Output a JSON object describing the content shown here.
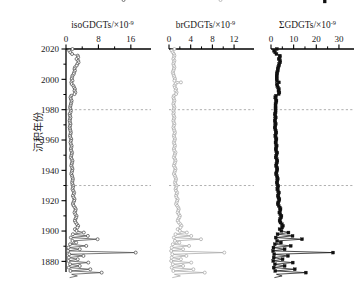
{
  "figure": {
    "background": "#ffffff",
    "y_axis": {
      "label_cn": "沉积年份",
      "label_meaning": "sedimentation-year",
      "ticks": [
        2020,
        2000,
        1980,
        1960,
        1940,
        1920,
        1900,
        1880
      ],
      "range": [
        1873,
        2020
      ],
      "minor_tick_step": 10
    },
    "reference_lines": {
      "style": "dashed",
      "color": "#9a9a9a",
      "years": [
        1980,
        1930
      ]
    }
  },
  "chart_data": [
    {
      "type": "line",
      "title": "isoGDGTs/×10",
      "title_exponent": "-9",
      "panel_index": 0,
      "xlabel": "isoGDGTs/×10⁻⁹",
      "ylabel": "沉积年份",
      "xlim": [
        0,
        19
      ],
      "xticks": [
        0,
        8,
        16
      ],
      "minor_xticks": [
        4,
        12
      ],
      "ylim": [
        1873,
        2020
      ],
      "grid": false,
      "legend": "none",
      "marker": "circle",
      "color": "#4d4d4d",
      "x": [
        1.6,
        0.8,
        1.1,
        1.5,
        2.9,
        3.0,
        2.6,
        3.0,
        3.1,
        2.8,
        2.6,
        2.2,
        2.1,
        2.2,
        2.0,
        1.9,
        1.6,
        1.5,
        1.4,
        1.6,
        1.3,
        1.4,
        1.8,
        2.0,
        2.2,
        2.1,
        2.3,
        2.1,
        1.3,
        1.1,
        1.2,
        1.4,
        1.3,
        1.2,
        1.1,
        1.0,
        1.1,
        1.2,
        1.1,
        0.9,
        1.0,
        1.1,
        1.0,
        0.9,
        1.0,
        1.1,
        1.0,
        0.9,
        1.0,
        1.1,
        1.2,
        1.1,
        1.0,
        1.1,
        1.3,
        1.2,
        1.1,
        1.2,
        1.4,
        1.3,
        1.2,
        1.3,
        1.5,
        1.4,
        1.3,
        1.2,
        1.4,
        1.6,
        1.5,
        1.4,
        1.3,
        1.5,
        1.6,
        1.5,
        1.4,
        1.3,
        1.5,
        1.6,
        1.7,
        1.6,
        1.5,
        1.6,
        1.8,
        1.7,
        1.6,
        1.8,
        2.0,
        1.9,
        1.7,
        1.9,
        2.1,
        2.0,
        1.8,
        1.7,
        1.9,
        2.2,
        2.4,
        2.3,
        2.1,
        2.3,
        2.6,
        2.5,
        2.3,
        2.2,
        2.4,
        2.7,
        3.0,
        2.8,
        2.2,
        2.6,
        4.4,
        1.7,
        5.4,
        1.2,
        7.8,
        1.6,
        2.5,
        1.0,
        5.0,
        0.6,
        3.4,
        0.5,
        17.2,
        0.8,
        4.3,
        0.7,
        2.9,
        0.6,
        5.5,
        1.0,
        3.4,
        0.7,
        6.0,
        1.1,
        8.8,
        1.4,
        2.8,
        0.9,
        14.2
      ],
      "y": [
        2020,
        2018.9,
        2017.8,
        2016.7,
        2015.6,
        2014.5,
        2013.4,
        2012.3,
        2011.2,
        2010.1,
        2009,
        2007.9,
        2006.8,
        2005.7,
        2004.6,
        2003.5,
        2002.4,
        2001.3,
        2000.2,
        1999.1,
        1998,
        1996.9,
        1995.8,
        1994.7,
        1993.6,
        1992.5,
        1991.4,
        1990.3,
        1989.2,
        1988.1,
        1987,
        1985.9,
        1984.8,
        1983.7,
        1982.6,
        1981.5,
        1980.4,
        1979.3,
        1978.2,
        1977.1,
        1976,
        1974.9,
        1973.8,
        1972.7,
        1971.6,
        1970.5,
        1969.4,
        1968.3,
        1967.2,
        1966.1,
        1965,
        1963.9,
        1962.8,
        1961.7,
        1960.6,
        1959.5,
        1958.4,
        1957.3,
        1956.2,
        1955.1,
        1954,
        1952.9,
        1951.8,
        1950.7,
        1949.6,
        1948.5,
        1947.4,
        1946.3,
        1945.2,
        1944.1,
        1943,
        1941.9,
        1940.8,
        1939.7,
        1938.6,
        1937.5,
        1936.4,
        1935.3,
        1934.2,
        1933.1,
        1932,
        1930.9,
        1929.8,
        1928.7,
        1927.6,
        1926.5,
        1925.4,
        1924.3,
        1923.2,
        1922.1,
        1921,
        1919.9,
        1918.8,
        1917.7,
        1916.6,
        1915.5,
        1914.4,
        1913.3,
        1912.2,
        1911.1,
        1910,
        1908.9,
        1907.8,
        1906.7,
        1905.6,
        1904.5,
        1903.4,
        1902.3,
        1901.2,
        1900.1,
        1899,
        1897.9,
        1896.8,
        1895.7,
        1894.6,
        1893.5,
        1892.4,
        1891.3,
        1890.2,
        1889.1,
        1888,
        1886.9,
        1885.8,
        1884.7,
        1883.6,
        1882.5,
        1881.4,
        1880.3,
        1879.2,
        1878.1,
        1877,
        1875.9,
        1874.8,
        1873.7,
        1872.6,
        1871.5,
        1870.4,
        1869.3
      ]
    },
    {
      "type": "line",
      "title": "brGDGTs/×10",
      "title_exponent": "-9",
      "panel_index": 1,
      "xlabel": "brGDGTs/×10⁻⁹",
      "ylabel": "沉积年份",
      "xlim": [
        0,
        14.2
      ],
      "xticks": [
        0,
        4,
        8,
        12
      ],
      "minor_xticks": [
        2,
        6,
        10
      ],
      "ylim": [
        1873,
        2020
      ],
      "grid": false,
      "legend": "none",
      "marker": "circle",
      "color": "#a8a8a8",
      "x": [
        1.0,
        0.5,
        0.7,
        0.9,
        1.0,
        0.9,
        0.8,
        1.0,
        0.9,
        0.8,
        0.9,
        1.0,
        0.9,
        0.8,
        0.7,
        0.8,
        0.9,
        1.0,
        1.1,
        1.0,
        2.2,
        1.2,
        1.0,
        1.1,
        1.3,
        1.2,
        1.4,
        1.3,
        0.9,
        0.8,
        0.9,
        1.0,
        0.9,
        0.8,
        0.9,
        1.0,
        0.9,
        0.8,
        0.9,
        0.8,
        0.9,
        1.0,
        0.9,
        0.8,
        0.9,
        1.0,
        0.9,
        0.8,
        0.9,
        1.0,
        1.1,
        1.0,
        0.9,
        1.0,
        1.1,
        1.0,
        0.9,
        1.0,
        1.1,
        1.0,
        0.9,
        1.0,
        1.2,
        1.1,
        1.0,
        0.9,
        1.1,
        1.2,
        1.1,
        1.0,
        0.9,
        1.1,
        1.2,
        1.1,
        1.0,
        0.9,
        1.1,
        1.2,
        1.3,
        1.2,
        1.1,
        1.2,
        1.4,
        1.3,
        1.2,
        1.3,
        1.5,
        1.4,
        1.3,
        1.4,
        1.6,
        1.5,
        1.4,
        1.3,
        1.5,
        1.7,
        1.8,
        1.7,
        1.6,
        1.8,
        2.0,
        1.9,
        1.7,
        1.6,
        1.8,
        2.1,
        2.3,
        2.1,
        1.6,
        2.0,
        3.3,
        1.2,
        4.1,
        0.9,
        5.9,
        1.1,
        1.9,
        0.7,
        3.7,
        0.5,
        2.6,
        0.4,
        10.2,
        0.6,
        3.2,
        0.5,
        2.2,
        0.4,
        4.1,
        0.7,
        2.6,
        0.5,
        4.5,
        0.8,
        6.6,
        1.0,
        2.1,
        0.6,
        9.5
      ],
      "y": [
        2020,
        2018.9,
        2017.8,
        2016.7,
        2015.6,
        2014.5,
        2013.4,
        2012.3,
        2011.2,
        2010.1,
        2009,
        2007.9,
        2006.8,
        2005.7,
        2004.6,
        2003.5,
        2002.4,
        2001.3,
        2000.2,
        1999.1,
        1998,
        1996.9,
        1995.8,
        1994.7,
        1993.6,
        1992.5,
        1991.4,
        1990.3,
        1989.2,
        1988.1,
        1987,
        1985.9,
        1984.8,
        1983.7,
        1982.6,
        1981.5,
        1980.4,
        1979.3,
        1978.2,
        1977.1,
        1976,
        1974.9,
        1973.8,
        1972.7,
        1971.6,
        1970.5,
        1969.4,
        1968.3,
        1967.2,
        1966.1,
        1965,
        1963.9,
        1962.8,
        1961.7,
        1960.6,
        1959.5,
        1958.4,
        1957.3,
        1956.2,
        1955.1,
        1954,
        1952.9,
        1951.8,
        1950.7,
        1949.6,
        1948.5,
        1947.4,
        1946.3,
        1945.2,
        1944.1,
        1943,
        1941.9,
        1940.8,
        1939.7,
        1938.6,
        1937.5,
        1936.4,
        1935.3,
        1934.2,
        1933.1,
        1932,
        1930.9,
        1929.8,
        1928.7,
        1927.6,
        1926.5,
        1925.4,
        1924.3,
        1923.2,
        1922.1,
        1921,
        1919.9,
        1918.8,
        1917.7,
        1916.6,
        1915.5,
        1914.4,
        1913.3,
        1912.2,
        1911.1,
        1910,
        1908.9,
        1907.8,
        1906.7,
        1905.6,
        1904.5,
        1903.4,
        1902.3,
        1901.2,
        1900.1,
        1899,
        1897.9,
        1896.8,
        1895.7,
        1894.6,
        1893.5,
        1892.4,
        1891.3,
        1890.2,
        1889.1,
        1888,
        1886.9,
        1885.8,
        1884.7,
        1883.6,
        1882.5,
        1881.4,
        1880.3,
        1879.2,
        1878.1,
        1877,
        1875.9,
        1874.8,
        1873.7,
        1872.6,
        1871.5,
        1870.4,
        1869.3
      ]
    },
    {
      "type": "line",
      "title": "ΣGDGTs/×10",
      "title_exponent": "-9",
      "panel_index": 2,
      "xlabel": "ΣGDGTs/×10⁻⁹",
      "ylabel": "沉积年份",
      "xlim": [
        0,
        34
      ],
      "xticks": [
        0,
        10,
        20,
        30
      ],
      "minor_xticks": [
        5,
        15,
        25
      ],
      "ylim": [
        1873,
        2020
      ],
      "grid": false,
      "legend": "none",
      "marker": "square",
      "color": "#111111",
      "x": [
        2.6,
        1.3,
        1.8,
        2.4,
        3.9,
        3.9,
        3.4,
        4.0,
        4.0,
        3.6,
        3.5,
        3.2,
        3.0,
        3.0,
        2.7,
        2.7,
        2.5,
        2.5,
        2.5,
        2.6,
        3.5,
        2.6,
        2.8,
        3.1,
        3.5,
        3.3,
        3.7,
        3.4,
        2.2,
        1.9,
        2.1,
        2.4,
        2.2,
        2.0,
        2.0,
        2.0,
        2.0,
        2.0,
        2.0,
        1.7,
        1.9,
        2.1,
        1.9,
        1.7,
        1.9,
        2.1,
        1.9,
        1.7,
        1.9,
        2.1,
        2.3,
        2.1,
        1.9,
        2.1,
        2.4,
        2.2,
        2.0,
        2.2,
        2.5,
        2.3,
        2.1,
        2.3,
        2.7,
        2.5,
        2.3,
        2.1,
        2.5,
        2.8,
        2.6,
        2.4,
        2.2,
        2.6,
        2.8,
        2.6,
        2.4,
        2.2,
        2.6,
        2.8,
        3.0,
        2.8,
        2.6,
        2.8,
        3.2,
        3.0,
        2.8,
        3.1,
        3.5,
        3.3,
        3.0,
        3.3,
        3.7,
        3.5,
        3.2,
        3.0,
        3.4,
        3.9,
        4.2,
        4.0,
        3.7,
        4.1,
        4.6,
        4.4,
        4.0,
        3.8,
        4.2,
        4.8,
        5.3,
        4.9,
        3.8,
        4.6,
        7.7,
        2.9,
        9.5,
        2.1,
        13.7,
        2.7,
        4.4,
        1.7,
        8.7,
        1.1,
        6.0,
        0.9,
        27.4,
        1.4,
        7.5,
        1.2,
        5.1,
        1.0,
        9.6,
        1.7,
        6.0,
        1.2,
        10.5,
        1.9,
        15.4,
        2.4,
        4.9,
        1.5,
        23.7
      ],
      "y": [
        2020,
        2018.9,
        2017.8,
        2016.7,
        2015.6,
        2014.5,
        2013.4,
        2012.3,
        2011.2,
        2010.1,
        2009,
        2007.9,
        2006.8,
        2005.7,
        2004.6,
        2003.5,
        2002.4,
        2001.3,
        2000.2,
        1999.1,
        1998,
        1996.9,
        1995.8,
        1994.7,
        1993.6,
        1992.5,
        1991.4,
        1990.3,
        1989.2,
        1988.1,
        1987,
        1985.9,
        1984.8,
        1983.7,
        1982.6,
        1981.5,
        1980.4,
        1979.3,
        1978.2,
        1977.1,
        1976,
        1974.9,
        1973.8,
        1972.7,
        1971.6,
        1970.5,
        1969.4,
        1968.3,
        1967.2,
        1966.1,
        1965,
        1963.9,
        1962.8,
        1961.7,
        1960.6,
        1959.5,
        1958.4,
        1957.3,
        1956.2,
        1955.1,
        1954,
        1952.9,
        1951.8,
        1950.7,
        1949.6,
        1948.5,
        1947.4,
        1946.3,
        1945.2,
        1944.1,
        1943,
        1941.9,
        1940.8,
        1939.7,
        1938.6,
        1937.5,
        1936.4,
        1935.3,
        1934.2,
        1933.1,
        1932,
        1930.9,
        1929.8,
        1928.7,
        1927.6,
        1926.5,
        1925.4,
        1924.3,
        1923.2,
        1922.1,
        1921,
        1919.9,
        1918.8,
        1917.7,
        1916.6,
        1915.5,
        1914.4,
        1913.3,
        1912.2,
        1911.1,
        1910,
        1908.9,
        1907.8,
        1906.7,
        1905.6,
        1904.5,
        1903.4,
        1902.3,
        1901.2,
        1900.1,
        1899,
        1897.9,
        1896.8,
        1895.7,
        1894.6,
        1893.5,
        1892.4,
        1891.3,
        1890.2,
        1889.1,
        1888,
        1886.9,
        1885.8,
        1884.7,
        1883.6,
        1882.5,
        1881.4,
        1880.3,
        1879.2,
        1878.1,
        1877,
        1875.9,
        1874.8,
        1873.7,
        1872.6,
        1871.5,
        1870.4,
        1869.3
      ]
    }
  ]
}
